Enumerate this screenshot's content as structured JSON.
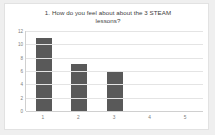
{
  "card": {
    "background": "#ffffff",
    "border_color": "#e2e2e2"
  },
  "chart_data": {
    "type": "bar",
    "title": "1. How do you feel about about the 3 STEAM lessons?",
    "title_line_1": "1. How do you feel about about the 3 STEAM",
    "title_line_2": "lessons?",
    "categories": [
      "1",
      "2",
      "3",
      "4",
      "5"
    ],
    "values": [
      11,
      7,
      6,
      0,
      0
    ],
    "xlabel": "",
    "ylabel": "",
    "ylim": [
      0,
      12
    ],
    "y_ticks": [
      "12",
      "10",
      "8",
      "6",
      "4",
      "2",
      "0"
    ],
    "y_tick_values": [
      12,
      10,
      8,
      6,
      4,
      2,
      0
    ],
    "grid": true,
    "grid_orientation": "horizontal",
    "legend": false,
    "bar_color": "#595959",
    "gridline_color": "#e4e4e4",
    "axis_color": "#d0d0d0",
    "tick_label_color": "#7c7c7c",
    "title_color": "#3d3d3d"
  }
}
